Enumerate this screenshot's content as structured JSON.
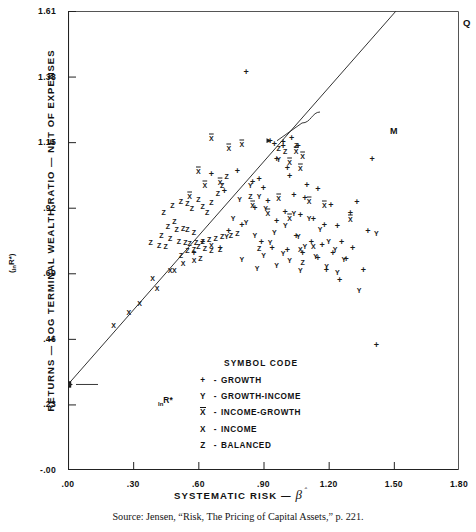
{
  "chart_data": {
    "type": "scatter",
    "title": "",
    "xlabel": "SYSTEMATIC RISK —",
    "xlabel_symbol": "β̂",
    "ylabel": "RETURNS — LOG TERMINAL WEALTH RATIO — NET OF EXPENSES",
    "ylabel_symbol": "(lnR*)",
    "xlim": [
      0.0,
      1.8
    ],
    "ylim": [
      -0.0,
      1.61
    ],
    "xticks": [
      ".00",
      ".30",
      ".60",
      ".90",
      "1.20",
      "1.50",
      "1.80"
    ],
    "xtick_values": [
      0.0,
      0.3,
      0.6,
      0.9,
      1.2,
      1.5,
      1.8
    ],
    "yticks": [
      "-.00",
      ".23",
      ".46",
      ".69",
      ".92",
      "1.15",
      "1.38",
      "1.61"
    ],
    "ytick_values": [
      0.0,
      0.23,
      0.46,
      0.69,
      0.92,
      1.15,
      1.38,
      1.61
    ],
    "grid": false,
    "legend_position": "inside-lower-center",
    "fit_line": {
      "label": "market line",
      "x0": 0.0,
      "y0": 0.3,
      "x1": 1.51,
      "y1": 1.61,
      "intercept_marker": "square",
      "intercept_label": "lnR*"
    },
    "annotations": [
      {
        "name": "M",
        "text": "M",
        "x": 0.93,
        "y": 1.155,
        "note": "market portfolio on line"
      },
      {
        "name": "Q",
        "text": "Q",
        "x": 1.5,
        "y": 1.6,
        "note": "upper end of line"
      },
      {
        "name": "R-star",
        "text": "lnR*",
        "x": 0.0,
        "y": 0.3,
        "note": "intercept on vertical axis"
      }
    ],
    "series": [
      {
        "name": "GROWTH",
        "symbol": "+",
        "points": [
          [
            0.82,
            1.395
          ],
          [
            1.03,
            1.165
          ],
          [
            1.4,
            1.09
          ],
          [
            0.99,
            1.135
          ],
          [
            0.96,
            1.09
          ],
          [
            1.01,
            1.06
          ],
          [
            0.88,
            1.02
          ],
          [
            0.93,
            1.155
          ],
          [
            0.95,
            1.145
          ],
          [
            0.99,
            1.15
          ],
          [
            1.06,
            1.135
          ],
          [
            1.02,
            1.03
          ],
          [
            1.1,
            1.0
          ],
          [
            1.15,
            0.985
          ],
          [
            1.04,
            0.965
          ],
          [
            1.09,
            0.955
          ],
          [
            1.21,
            0.93
          ],
          [
            0.78,
            1.05
          ],
          [
            0.85,
            1.01
          ],
          [
            0.9,
            0.99
          ],
          [
            0.92,
            0.945
          ],
          [
            1.0,
            0.905
          ],
          [
            1.07,
            0.895
          ],
          [
            0.96,
            0.875
          ],
          [
            1.13,
            0.88
          ],
          [
            1.18,
            0.86
          ],
          [
            1.24,
            0.855
          ],
          [
            1.3,
            0.9
          ],
          [
            1.33,
            0.94
          ],
          [
            1.05,
            0.82
          ],
          [
            1.12,
            0.8
          ],
          [
            1.17,
            0.79
          ],
          [
            1.26,
            0.8
          ],
          [
            1.22,
            0.76
          ],
          [
            1.28,
            0.74
          ],
          [
            1.19,
            0.7
          ],
          [
            1.25,
            0.665
          ],
          [
            1.36,
            0.7
          ],
          [
            1.42,
            0.44
          ],
          [
            0.86,
            0.92
          ],
          [
            0.72,
            0.98
          ],
          [
            0.66,
            1.04
          ],
          [
            1.08,
            0.76
          ],
          [
            1.15,
            0.745
          ],
          [
            0.8,
            0.86
          ],
          [
            0.74,
            0.84
          ],
          [
            0.62,
            0.8
          ],
          [
            0.7,
            0.78
          ],
          [
            0.58,
            0.76
          ],
          [
            1.31,
            0.78
          ],
          [
            1.38,
            0.84
          ],
          [
            0.89,
            0.8
          ],
          [
            0.94,
            0.78
          ],
          [
            1.01,
            0.77
          ]
        ]
      },
      {
        "name": "GROWTH-INCOME",
        "symbol": "Y",
        "points": [
          [
            0.97,
            1.09
          ],
          [
            0.84,
            1.0
          ],
          [
            0.88,
            0.96
          ],
          [
            0.79,
            0.95
          ],
          [
            0.91,
            0.92
          ],
          [
            1.04,
            0.9
          ],
          [
            1.11,
            0.885
          ],
          [
            0.76,
            0.885
          ],
          [
            0.82,
            0.87
          ],
          [
            1.0,
            0.86
          ],
          [
            1.16,
            0.845
          ],
          [
            0.95,
            0.835
          ],
          [
            0.86,
            0.825
          ],
          [
            1.06,
            0.82
          ],
          [
            0.93,
            0.8
          ],
          [
            1.2,
            0.805
          ],
          [
            0.73,
            0.82
          ],
          [
            1.09,
            0.785
          ],
          [
            1.23,
            0.775
          ],
          [
            0.99,
            0.76
          ],
          [
            0.9,
            0.755
          ],
          [
            1.14,
            0.75
          ],
          [
            1.02,
            0.735
          ],
          [
            1.27,
            0.74
          ],
          [
            0.96,
            0.72
          ],
          [
            1.19,
            0.715
          ],
          [
            1.34,
            0.63
          ],
          [
            1.07,
            0.7
          ],
          [
            0.87,
            0.71
          ],
          [
            1.42,
            0.83
          ],
          [
            0.8,
            0.74
          ],
          [
            1.24,
            0.695
          ]
        ]
      },
      {
        "name": "INCOME-GROWTH",
        "symbol": "X̄",
        "points": [
          [
            0.66,
            1.165
          ],
          [
            0.74,
            1.13
          ],
          [
            0.6,
            1.05
          ],
          [
            0.7,
            1.01
          ],
          [
            0.8,
            1.145
          ],
          [
            1.05,
            1.12
          ],
          [
            1.08,
            1.1
          ],
          [
            1.07,
            1.06
          ],
          [
            1.02,
            1.08
          ],
          [
            0.63,
            1.0
          ],
          [
            0.97,
            0.955
          ],
          [
            1.11,
            0.945
          ],
          [
            0.56,
            0.96
          ],
          [
            1.18,
            0.93
          ],
          [
            1.3,
            0.88
          ],
          [
            0.85,
            0.93
          ],
          [
            0.92,
            0.9
          ],
          [
            1.02,
            0.885
          ]
        ]
      },
      {
        "name": "INCOME",
        "symbol": "X",
        "points": [
          [
            0.21,
            0.51
          ],
          [
            0.28,
            0.555
          ],
          [
            0.33,
            0.585
          ],
          [
            0.41,
            0.64
          ],
          [
            0.47,
            0.7
          ],
          [
            0.53,
            0.725
          ],
          [
            0.39,
            0.675
          ],
          [
            1.13,
            0.785
          ],
          [
            1.07,
            0.775
          ],
          [
            0.58,
            0.735
          ],
          [
            0.49,
            0.7
          ],
          [
            0.66,
            0.79
          ]
        ]
      },
      {
        "name": "BALANCED",
        "symbol": "Z",
        "points": [
          [
            0.48,
            0.93
          ],
          [
            0.52,
            0.945
          ],
          [
            0.55,
            0.935
          ],
          [
            0.57,
            0.92
          ],
          [
            0.44,
            0.905
          ],
          [
            0.49,
            0.875
          ],
          [
            0.6,
            0.95
          ],
          [
            0.62,
            0.925
          ],
          [
            0.64,
            0.905
          ],
          [
            0.66,
            0.94
          ],
          [
            0.69,
            0.97
          ],
          [
            0.71,
            1.0
          ],
          [
            0.73,
            1.03
          ],
          [
            0.46,
            0.855
          ],
          [
            0.5,
            0.845
          ],
          [
            0.53,
            0.85
          ],
          [
            0.55,
            0.845
          ],
          [
            0.58,
            0.835
          ],
          [
            0.43,
            0.825
          ],
          [
            0.47,
            0.815
          ],
          [
            0.51,
            0.805
          ],
          [
            0.54,
            0.8
          ],
          [
            0.56,
            0.795
          ],
          [
            0.59,
            0.8
          ],
          [
            0.62,
            0.805
          ],
          [
            0.65,
            0.81
          ],
          [
            0.68,
            0.815
          ],
          [
            0.71,
            0.82
          ],
          [
            0.75,
            0.825
          ],
          [
            0.78,
            0.83
          ],
          [
            0.38,
            0.8
          ],
          [
            0.42,
            0.79
          ],
          [
            0.45,
            0.785
          ],
          [
            0.6,
            0.785
          ],
          [
            0.63,
            0.78
          ],
          [
            0.58,
            0.775
          ],
          [
            0.55,
            0.77
          ],
          [
            0.66,
            0.77
          ],
          [
            0.7,
            0.775
          ],
          [
            0.52,
            0.755
          ],
          [
            0.61,
            0.745
          ],
          [
            0.97,
            1.13
          ],
          [
            1.0,
            1.12
          ],
          [
            1.05,
            1.14
          ],
          [
            0.84,
            0.96
          ],
          [
            1.08,
            0.73
          ],
          [
            0.88,
            0.78
          ]
        ]
      }
    ]
  },
  "legend": {
    "title": "SYMBOL CODE",
    "dash": "-",
    "rows": [
      {
        "symbol": "+",
        "label": "GROWTH"
      },
      {
        "symbol": "Y",
        "label": "GROWTH-INCOME"
      },
      {
        "symbol": "X",
        "label": "INCOME-GROWTH",
        "overbar": true
      },
      {
        "symbol": "X",
        "label": "INCOME"
      },
      {
        "symbol": "Z",
        "label": "BALANCED"
      }
    ]
  },
  "annotations": {
    "m": "M",
    "q": "Q",
    "r_star_prefix": "ln",
    "r_star_body": "R*"
  },
  "source": {
    "text": "Source: Jensen, “Risk, The Pricing of Capital Assets,” p. 221."
  }
}
